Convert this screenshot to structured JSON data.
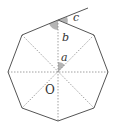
{
  "diagram": {
    "type": "regular-octagon-angles",
    "center_label": "O",
    "angle_labels": {
      "a": "a",
      "b": "b",
      "c": "c"
    },
    "colors": {
      "outline": "#555555",
      "dashed": "#888888",
      "shade": "#b5b5b5",
      "text": "#333333",
      "background": "#ffffff"
    }
  }
}
